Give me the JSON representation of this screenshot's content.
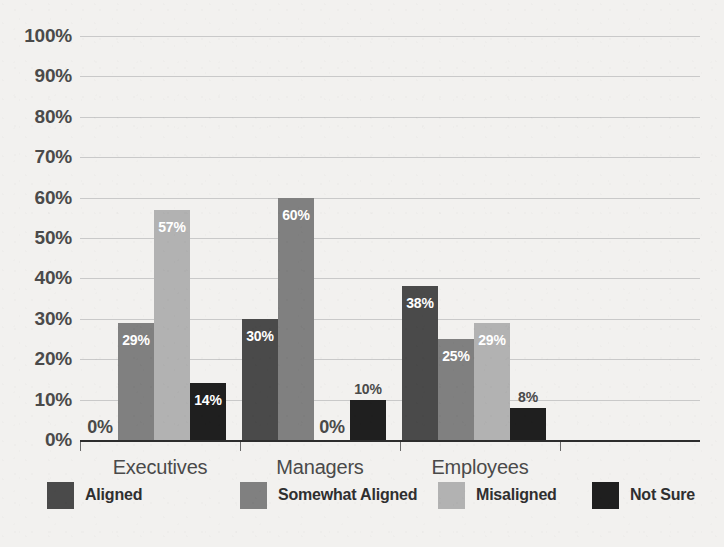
{
  "chart_data": {
    "type": "bar",
    "title": "",
    "subtitle": "",
    "xlabel": "",
    "ylabel": "",
    "grid": true,
    "legend_position": "bottom",
    "ylim": [
      0,
      100
    ],
    "y_ticks": [
      "0%",
      "10%",
      "20%",
      "30%",
      "40%",
      "50%",
      "60%",
      "70%",
      "80%",
      "90%",
      "100%"
    ],
    "y_tick_values": [
      0,
      10,
      20,
      30,
      40,
      50,
      60,
      70,
      80,
      90,
      100
    ],
    "categories": [
      "Executives",
      "Managers",
      "Employees"
    ],
    "series": [
      {
        "name": "Aligned",
        "color": "#4a4a4a",
        "values": [
          0,
          30,
          38
        ],
        "labels": [
          "0%",
          "30%",
          "38%"
        ]
      },
      {
        "name": "Somewhat Aligned",
        "color": "#808080",
        "values": [
          29,
          60,
          25
        ],
        "labels": [
          "29%",
          "60%",
          "25%"
        ]
      },
      {
        "name": "Misaligned",
        "color": "#b2b2b2",
        "values": [
          57,
          0,
          29
        ],
        "labels": [
          "57%",
          "0%",
          "29%"
        ]
      },
      {
        "name": "Not Sure",
        "color": "#1f1f1f",
        "values": [
          14,
          10,
          8
        ],
        "labels": [
          "14%",
          "10%",
          "8%"
        ]
      }
    ]
  },
  "legend": {
    "items": [
      {
        "label": "Aligned",
        "color": "#4a4a4a"
      },
      {
        "label": "Somewhat Aligned",
        "color": "#808080"
      },
      {
        "label": "Misaligned",
        "color": "#b2b2b2"
      },
      {
        "label": "Not Sure",
        "color": "#1f1f1f"
      }
    ]
  },
  "colors": {
    "background": "#f2f1ef",
    "gridline": "#c9c9c9",
    "axis": "#2d2d2d",
    "tick_text": "#4a4a4a",
    "value_inside": "#ffffff",
    "value_outside": "#4a4a4a"
  }
}
